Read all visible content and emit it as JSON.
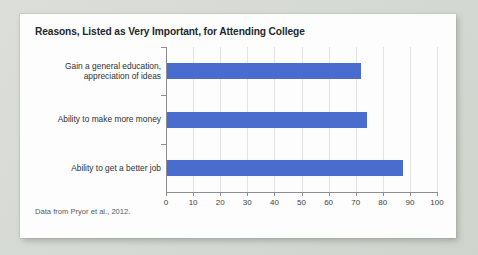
{
  "chart_data": {
    "type": "bar",
    "orientation": "horizontal",
    "title": "Reasons, Listed as Very Important, for Attending College",
    "source_note": "Data from Pryor et al., 2012.",
    "categories": [
      "Gain a general education, appreciation of ideas",
      "Ability to make more money",
      "Ability to get a better job"
    ],
    "category_lines": [
      [
        "Gain a general education,",
        "appreciation of ideas"
      ],
      [
        "Ability to make more money"
      ],
      [
        "Ability to get a better job"
      ]
    ],
    "values": [
      72,
      74,
      87.5
    ],
    "xlabel": "",
    "ylabel": "",
    "xlim": [
      0,
      100
    ],
    "xticks": [
      0,
      10,
      20,
      30,
      40,
      50,
      60,
      70,
      80,
      90,
      100
    ],
    "xtick_labels": [
      "0",
      "10",
      "20",
      "30",
      "40",
      "50",
      "60",
      "70",
      "80",
      "90",
      "100"
    ],
    "grid": "vertical",
    "legend": "none",
    "bar_color": "#4a6cce",
    "gridline_color": "#e3e3e3",
    "axis_color": "#8d8d8d",
    "card_background": "#fdfdfd",
    "page_background": "#d9dcd6"
  }
}
